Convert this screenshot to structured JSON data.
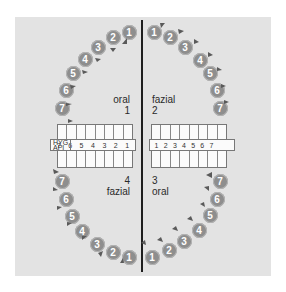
{
  "labels": {
    "upper_left": {
      "side": "oral",
      "quadrant": "1"
    },
    "upper_right": {
      "side": "fazial",
      "quadrant": "2"
    },
    "lower_left": {
      "quadrant": "4",
      "side": "fazial"
    },
    "lower_right": {
      "quadrant": "3",
      "side": "oral"
    }
  },
  "index_row": {
    "label_line1": "HYG",
    "label_line2": "API",
    "left_numbers": [
      "7",
      "6",
      "5",
      "4",
      "3",
      "2",
      "1"
    ],
    "right_numbers": [
      "1",
      "2",
      "3",
      "4",
      "5",
      "6",
      "7"
    ]
  },
  "teeth": {
    "upper_left": [
      "1",
      "2",
      "3",
      "4",
      "5",
      "6",
      "7"
    ],
    "upper_right": [
      "1",
      "2",
      "3",
      "4",
      "5",
      "6",
      "7"
    ],
    "lower_left": [
      "1",
      "2",
      "3",
      "4",
      "5",
      "6",
      "7"
    ],
    "lower_right": [
      "1",
      "2",
      "3",
      "4",
      "5",
      "6",
      "7"
    ]
  },
  "colors": {
    "panel": "#e3e3e3",
    "tooth": "#8e8e8e",
    "marker": "#5a5a5a",
    "midline": "#1e1e1e"
  }
}
